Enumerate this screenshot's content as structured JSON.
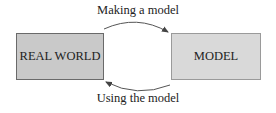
{
  "diagram": {
    "nodes": [
      {
        "id": "real_world",
        "label": "REAL WORLD"
      },
      {
        "id": "model",
        "label": "MODEL"
      }
    ],
    "edges": [
      {
        "from": "real_world",
        "to": "model",
        "label": "Making a model"
      },
      {
        "from": "model",
        "to": "real_world",
        "label": "Using the model"
      }
    ],
    "colors": {
      "real_world_fill": "#c9c9c9",
      "real_world_border": "#6a6a6a",
      "model_fill": "#d9d9d9",
      "model_border": "#9a9a9a",
      "arrow": "#555555"
    }
  }
}
